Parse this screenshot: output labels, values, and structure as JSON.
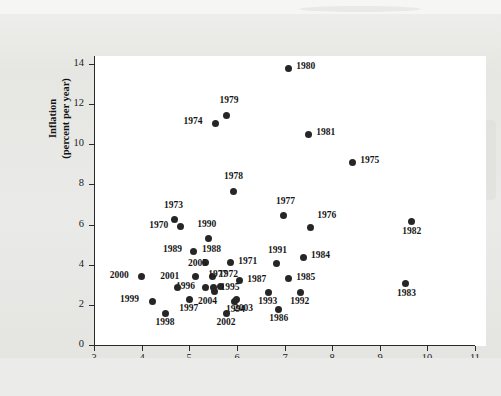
{
  "figure": {
    "background_color": "#e9e9e7",
    "plot_background_color": "#ffffff",
    "point_color": "#262626"
  },
  "chart_data": {
    "type": "scatter",
    "title": "",
    "xlabel": "Civilian unemployment rate (percent)",
    "ylabel": "Inflation (percent per year)",
    "ylabel_line1": "Inflation",
    "ylabel_line2": "(percent per year)",
    "xlim": [
      3,
      11
    ],
    "ylim": [
      0,
      14
    ],
    "xticks": [
      3,
      4,
      5,
      6,
      7,
      8,
      9,
      10,
      11
    ],
    "yticks": [
      0,
      2,
      4,
      6,
      8,
      10,
      12,
      14
    ],
    "grid": false,
    "legend": "none",
    "points": [
      {
        "label": "1970",
        "x": 4.81,
        "y": 5.88,
        "lx": -31,
        "ly": -4
      },
      {
        "label": "1971",
        "x": 5.86,
        "y": 4.09,
        "lx": 8,
        "ly": -4
      },
      {
        "label": "1972",
        "x": 5.48,
        "y": 3.41,
        "lx": 7,
        "ly": -5
      },
      {
        "label": "1973",
        "x": 4.68,
        "y": 6.23,
        "lx": -10,
        "ly": -17
      },
      {
        "label": "1974",
        "x": 5.55,
        "y": 11.05,
        "lx": -32,
        "ly": -4
      },
      {
        "label": "1975",
        "x": 8.42,
        "y": 9.11,
        "lx": 8,
        "ly": -4
      },
      {
        "label": "1976",
        "x": 7.54,
        "y": 5.83,
        "lx": 7,
        "ly": -15
      },
      {
        "label": "1977",
        "x": 6.97,
        "y": 6.43,
        "lx": -7,
        "ly": -17
      },
      {
        "label": "1977",
        "x": 5.65,
        "y": 2.9,
        "lx": -12,
        "ly": -15
      },
      {
        "label": "1978",
        "x": 5.92,
        "y": 7.67,
        "lx": -9,
        "ly": -17
      },
      {
        "label": "1979",
        "x": 5.78,
        "y": 11.45,
        "lx": -7,
        "ly": -17
      },
      {
        "label": "1980",
        "x": 7.08,
        "y": 13.8,
        "lx": 8,
        "ly": -4
      },
      {
        "label": "1981",
        "x": 7.5,
        "y": 10.5,
        "lx": 8,
        "ly": -4
      },
      {
        "label": "1982",
        "x": 9.66,
        "y": 6.13,
        "lx": -9,
        "ly": 7
      },
      {
        "label": "1983",
        "x": 9.55,
        "y": 3.04,
        "lx": -9,
        "ly": 7
      },
      {
        "label": "1984",
        "x": 7.39,
        "y": 4.38,
        "lx": 8,
        "ly": -4
      },
      {
        "label": "1985",
        "x": 7.08,
        "y": 3.29,
        "lx": 8,
        "ly": -4
      },
      {
        "label": "1986",
        "x": 6.87,
        "y": 1.79,
        "lx": -9,
        "ly": 7
      },
      {
        "label": "1987",
        "x": 6.05,
        "y": 3.19,
        "lx": 8,
        "ly": -4
      },
      {
        "label": "1988",
        "x": 5.35,
        "y": 4.13,
        "lx": -4,
        "ly": -15
      },
      {
        "label": "1989",
        "x": 5.08,
        "y": 4.68,
        "lx": -30,
        "ly": -4
      },
      {
        "label": "1990",
        "x": 5.4,
        "y": 5.33,
        "lx": -11,
        "ly": -16
      },
      {
        "label": "1991",
        "x": 6.84,
        "y": 4.04,
        "lx": -9,
        "ly": -16
      },
      {
        "label": "1992",
        "x": 7.33,
        "y": 2.64,
        "lx": -10,
        "ly": 7
      },
      {
        "label": "1993",
        "x": 6.66,
        "y": 2.64,
        "lx": -10,
        "ly": 7
      },
      {
        "label": "1994",
        "x": 5.94,
        "y": 2.19,
        "lx": -8,
        "ly": 6
      },
      {
        "label": "1995",
        "x": 5.51,
        "y": 2.84,
        "lx": 7,
        "ly": -3
      },
      {
        "label": "1996",
        "x": 5.35,
        "y": 2.84,
        "lx": -30,
        "ly": -4
      },
      {
        "label": "1997",
        "x": 5.0,
        "y": 2.25,
        "lx": -10,
        "ly": 6
      },
      {
        "label": "1998",
        "x": 4.5,
        "y": 1.58,
        "lx": -10,
        "ly": 7
      },
      {
        "label": "1999",
        "x": 4.22,
        "y": 2.18,
        "lx": -32,
        "ly": -4
      },
      {
        "label": "2000",
        "x": 4.0,
        "y": 3.4,
        "lx": -32,
        "ly": -4
      },
      {
        "label": "2001",
        "x": 4.75,
        "y": 2.86,
        "lx": -17,
        "ly": -14
      },
      {
        "label": "2002",
        "x": 5.78,
        "y": 1.58,
        "lx": -10,
        "ly": 7
      },
      {
        "label": "2003",
        "x": 6.0,
        "y": 2.28,
        "lx": -3,
        "ly": 7
      },
      {
        "label": "2004",
        "x": 5.52,
        "y": 2.68,
        "lx": -16,
        "ly": 8
      },
      {
        "label": "2005",
        "x": 5.14,
        "y": 3.39,
        "lx": -8,
        "ly": -16
      }
    ]
  }
}
